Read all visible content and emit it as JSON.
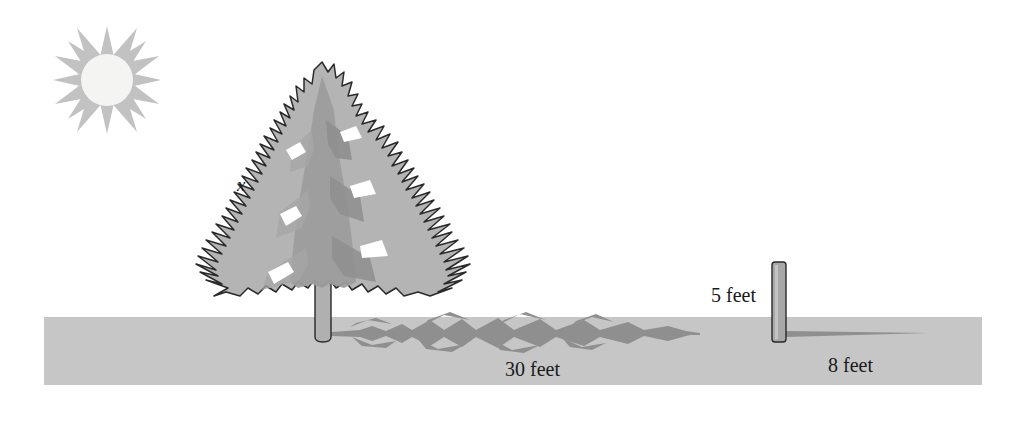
{
  "diagram": {
    "canvas": {
      "width": 1009,
      "height": 421,
      "background": "#ffffff"
    },
    "labels": {
      "tree_height": "x",
      "tree_shadow_length": "30 feet",
      "pole_height": "5 feet",
      "pole_shadow_length": "8 feet"
    },
    "objects": {
      "sun": {
        "name": "sun",
        "rays": 12,
        "center_x": 107,
        "center_y": 80,
        "disk_radius": 25,
        "ray_radius": 50
      },
      "tree": {
        "name": "pine-tree",
        "top_y": 62,
        "base_y": 341,
        "trunk_x": 322
      },
      "tree_shadow": {
        "name": "tree-shadow",
        "start_x": 330,
        "end_x": 700,
        "y": 334
      },
      "pole": {
        "name": "pole",
        "x": 772,
        "top_y": 262,
        "bottom_y": 342,
        "width": 14
      },
      "pole_shadow": {
        "name": "pole-shadow",
        "start_x": 786,
        "end_x": 928,
        "y": 334
      },
      "ground": {
        "name": "ground-band",
        "x": 44,
        "y": 317,
        "width": 938,
        "height": 68
      }
    },
    "colors": {
      "ground": "#c6c6c6",
      "sun_rays": "#c2c2c2",
      "sun_disk": "#f4f4f2",
      "foliage_light": "#b4b4b4",
      "foliage_mid": "#9d9d9d",
      "foliage_dark": "#8e8e8e",
      "outline": "#2a2a2a",
      "shadow": "#8f8f8f",
      "trunk": "#b0b0b0",
      "pole": "#a8a8a8",
      "text": "#1a1a1a"
    }
  }
}
